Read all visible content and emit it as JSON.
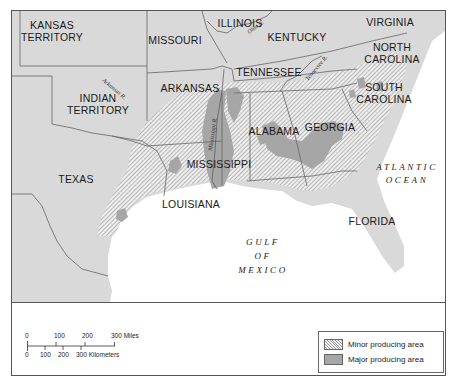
{
  "map": {
    "states": [
      {
        "name": "KANSAS TERRITORY",
        "lines": [
          "KANSAS",
          "TERRITORY"
        ]
      },
      {
        "name": "MISSOURI",
        "lines": [
          "MISSOURI"
        ]
      },
      {
        "name": "ILLINOIS",
        "lines": [
          "ILLINOIS"
        ]
      },
      {
        "name": "KENTUCKY",
        "lines": [
          "KENTUCKY"
        ]
      },
      {
        "name": "VIRGINIA",
        "lines": [
          "VIRGINIA"
        ]
      },
      {
        "name": "NORTH CAROLINA",
        "lines": [
          "NORTH",
          "CAROLINA"
        ]
      },
      {
        "name": "TENNESSEE",
        "lines": [
          "TENNESSEE"
        ]
      },
      {
        "name": "ARKANSAS",
        "lines": [
          "ARKANSAS"
        ]
      },
      {
        "name": "INDIAN TERRITORY",
        "lines": [
          "INDIAN",
          "TERRITORY"
        ]
      },
      {
        "name": "SOUTH CAROLINA",
        "lines": [
          "SOUTH",
          "CAROLINA"
        ]
      },
      {
        "name": "ALABAMA",
        "lines": [
          "ALABAMA"
        ]
      },
      {
        "name": "GEORGIA",
        "lines": [
          "GEORGIA"
        ]
      },
      {
        "name": "MISSISSIPPI",
        "lines": [
          "MISSISSIPPI"
        ]
      },
      {
        "name": "TEXAS",
        "lines": [
          "TEXAS"
        ]
      },
      {
        "name": "LOUISIANA",
        "lines": [
          "LOUISIANA"
        ]
      },
      {
        "name": "FLORIDA",
        "lines": [
          "FLORIDA"
        ]
      }
    ],
    "water_bodies": [
      {
        "name": "ATLANTIC OCEAN",
        "lines": [
          "ATLANTIC",
          "OCEAN"
        ]
      },
      {
        "name": "GULF OF MEXICO",
        "lines": [
          "GULF",
          "OF",
          "MEXICO"
        ]
      }
    ],
    "rivers": [
      "Arkansas R.",
      "Ohio R.",
      "Tennessee R.",
      "Mississippi R."
    ],
    "colors": {
      "land": "#d9d9d9",
      "water": "#ffffff",
      "major_area": "#a6a6a6",
      "minor_hatch": "#9a9a9a",
      "border": "#555555"
    }
  },
  "scale_bar": {
    "miles_ticks": [
      "0",
      "100",
      "200",
      "300 Miles"
    ],
    "km_ticks": [
      "0",
      "100",
      "200",
      "300 Kilometers"
    ]
  },
  "legend": {
    "items": [
      {
        "label": "Minor producing area",
        "style": "hatched"
      },
      {
        "label": "Major producing area",
        "style": "solid gray"
      }
    ]
  }
}
